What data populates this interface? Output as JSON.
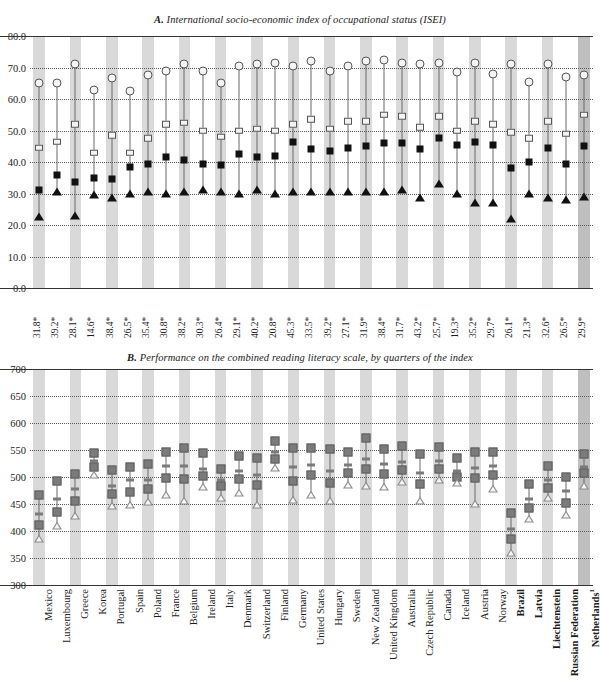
{
  "figure": {
    "panel_a_title_prefix": "A.",
    "panel_a_title": "International socio-economic index of occupational status (ISEI)",
    "panel_b_title_prefix": "B.",
    "panel_b_title": "Performance on the combined reading literacy scale, by quarters of the index"
  },
  "countries": [
    "Mexico",
    "Luxembourg",
    "Greece",
    "Korea",
    "Portugal",
    "Spain",
    "Poland",
    "France",
    "Belgium",
    "Ireland",
    "Italy",
    "Denmark",
    "Switzerland",
    "Finland",
    "Germany",
    "United States",
    "Hungary",
    "Sweden",
    "New Zealand",
    "United Kingdom",
    "Australia",
    "Czech Republic",
    "Canada",
    "Iceland",
    "Austria",
    "Norway",
    "Brazil",
    "Latvia",
    "Liechtenstein",
    "Russian Federation",
    "Netherlands"
  ],
  "country_superscripts": {
    "Netherlands": "1"
  },
  "bold_countries": [
    "Brazil",
    "Latvia",
    "Liechtenstein",
    "Russian Federation",
    "Netherlands"
  ],
  "index_values": [
    "31.8*",
    "39.2*",
    "28.1*",
    "14.6*",
    "38.4*",
    "26.5*",
    "35.4*",
    "30.8*",
    "38.2*",
    "30.3*",
    "26.4*",
    "29.1*",
    "40.2*",
    "20.8*",
    "45.3*",
    "33.5*",
    "39.2*",
    "27.1*",
    "31.9*",
    "38.4*",
    "31.7*",
    "43.2*",
    "25.7*",
    "19.3*",
    "35.2*",
    "29.7*",
    "26.1*",
    "21.3*",
    "32.6*",
    "26.5*",
    "29.9*"
  ],
  "chart_data": [
    {
      "type": "scatter",
      "panel": "A",
      "title": "A. International socio-economic index of occupational status (ISEI)",
      "xlabel": "",
      "ylabel": "",
      "ylim": [
        0.0,
        80.0
      ],
      "yticks": [
        "0.0",
        "10.0",
        "20.0",
        "30.0",
        "40.0",
        "50.0",
        "60.0",
        "70.0",
        "80.0"
      ],
      "grid": true,
      "legend": "none",
      "categories": [
        "Mexico",
        "Luxembourg",
        "Greece",
        "Korea",
        "Portugal",
        "Spain",
        "Poland",
        "France",
        "Belgium",
        "Ireland",
        "Italy",
        "Denmark",
        "Switzerland",
        "Finland",
        "Germany",
        "United States",
        "Hungary",
        "Sweden",
        "New Zealand",
        "United Kingdom",
        "Australia",
        "Czech Republic",
        "Canada",
        "Iceland",
        "Austria",
        "Norway",
        "Brazil",
        "Latvia",
        "Liechtenstein",
        "Russian Federation",
        "Netherlands"
      ],
      "series": [
        {
          "name": "Top quarter of index (open circle)",
          "marker": "open-circle",
          "values": [
            65.0,
            65.2,
            71.2,
            63.0,
            66.8,
            62.5,
            67.5,
            69.0,
            71.0,
            68.8,
            65.0,
            70.5,
            71.2,
            71.5,
            70.5,
            72.0,
            68.8,
            70.5,
            72.0,
            72.5,
            71.5,
            71.0,
            71.5,
            68.5,
            71.5,
            68.0,
            71.0,
            65.5,
            71.0,
            67.0,
            67.5
          ]
        },
        {
          "name": "Third quarter of index (open square)",
          "marker": "open-square",
          "values": [
            44.5,
            46.5,
            52.0,
            43.0,
            48.5,
            43.0,
            47.5,
            52.0,
            52.5,
            50.0,
            48.0,
            50.0,
            50.5,
            50.0,
            52.0,
            53.5,
            50.5,
            53.0,
            53.0,
            55.0,
            54.5,
            51.0,
            54.5,
            50.0,
            53.0,
            52.0,
            49.5,
            47.5,
            53.0,
            49.0,
            55.0
          ]
        },
        {
          "name": "Second quarter of index (filled square)",
          "marker": "filled-square",
          "values": [
            31.0,
            36.0,
            33.5,
            35.0,
            34.5,
            38.5,
            39.5,
            41.5,
            40.5,
            39.5,
            39.0,
            42.5,
            41.5,
            42.0,
            46.5,
            44.0,
            43.5,
            44.5,
            45.0,
            46.0,
            46.0,
            44.0,
            47.5,
            45.5,
            46.5,
            45.5,
            38.0,
            40.0,
            44.5,
            39.5,
            45.0
          ]
        },
        {
          "name": "Bottom quarter of index (filled triangle)",
          "marker": "filled-triangle",
          "values": [
            22.5,
            30.5,
            23.0,
            29.5,
            28.5,
            30.0,
            30.5,
            30.0,
            30.5,
            31.0,
            30.5,
            30.0,
            31.0,
            30.0,
            30.5,
            30.5,
            30.5,
            30.5,
            30.5,
            30.5,
            31.0,
            28.5,
            33.0,
            30.0,
            27.0,
            27.0,
            22.0,
            30.0,
            28.5,
            28.0,
            29.0
          ]
        }
      ]
    },
    {
      "type": "scatter",
      "panel": "B",
      "title": "B. Performance on the combined reading literacy scale, by quarters of the index",
      "xlabel": "",
      "ylabel": "",
      "ylim": [
        300,
        700
      ],
      "yticks": [
        "300",
        "350",
        "400",
        "450",
        "500",
        "550",
        "600",
        "650",
        "700"
      ],
      "grid": true,
      "legend": "none",
      "categories": [
        "Mexico",
        "Luxembourg",
        "Greece",
        "Korea",
        "Portugal",
        "Spain",
        "Poland",
        "France",
        "Belgium",
        "Ireland",
        "Italy",
        "Denmark",
        "Switzerland",
        "Finland",
        "Germany",
        "United States",
        "Hungary",
        "Sweden",
        "New Zealand",
        "United Kingdom",
        "Australia",
        "Czech Republic",
        "Canada",
        "Iceland",
        "Austria",
        "Norway",
        "Brazil",
        "Latvia",
        "Liechtenstein",
        "Russian Federation",
        "Netherlands"
      ],
      "series": [
        {
          "name": "Top quarter of index (grey square, upper)",
          "marker": "grey-square",
          "values": [
            466,
            493,
            505,
            545,
            513,
            518,
            525,
            546,
            553,
            545,
            514,
            538,
            536,
            566,
            553,
            553,
            551,
            546,
            573,
            552,
            558,
            543,
            556,
            535,
            546,
            547,
            433,
            487,
            520,
            500,
            542
          ]
        },
        {
          "name": "Third quarter of index (dash)",
          "marker": "dash",
          "values": [
            432,
            460,
            477,
            529,
            484,
            494,
            495,
            520,
            521,
            515,
            494,
            511,
            503,
            546,
            518,
            522,
            512,
            522,
            533,
            524,
            528,
            507,
            530,
            511,
            517,
            521,
            403,
            459,
            494,
            474,
            519
          ]
        },
        {
          "name": "Second quarter of index (grey square, lower)",
          "marker": "grey-square",
          "values": [
            411,
            436,
            455,
            518,
            468,
            473,
            477,
            499,
            497,
            501,
            483,
            497,
            486,
            534,
            493,
            503,
            489,
            508,
            515,
            505,
            513,
            487,
            515,
            500,
            498,
            504,
            385,
            443,
            479,
            451,
            507
          ]
        },
        {
          "name": "Bottom quarter of index (open triangle)",
          "marker": "open-triangle",
          "values": [
            385,
            410,
            428,
            503,
            447,
            449,
            453,
            466,
            456,
            481,
            461,
            471,
            449,
            517,
            457,
            466,
            456,
            486,
            483,
            481,
            490,
            455,
            494,
            489,
            450,
            478,
            360,
            422,
            461,
            430,
            483
          ]
        }
      ]
    }
  ]
}
